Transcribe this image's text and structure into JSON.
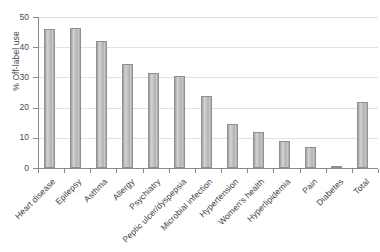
{
  "chart_data": {
    "type": "bar",
    "title": "",
    "xlabel": "",
    "ylabel": "% Off-label use",
    "ylim": [
      0,
      50
    ],
    "ytick_labels": [
      "0",
      "10",
      "20",
      "30",
      "40",
      "50"
    ],
    "yticks": [
      0,
      10,
      20,
      30,
      40,
      50
    ],
    "grid": true,
    "legend": "none",
    "categories": [
      "Heart disease",
      "Epilepsy",
      "Asthma",
      "Allergy",
      "Psychiatry",
      "Peptic ulcer/dyspepsia",
      "Microbial infection",
      "Hypertension",
      "Women's health",
      "Hyperlipidemia",
      "Pain",
      "Diabetes",
      "Total"
    ],
    "values": [
      46,
      46.2,
      42,
      34.5,
      31.5,
      30.5,
      24,
      14.5,
      11.8,
      9,
      7,
      0.8,
      22
    ]
  },
  "colors": {
    "bar_fill": "#c2c2c2",
    "bar_edge": "#8f8f8f",
    "gridline": "#e2e2e2",
    "axis": "#8a8a8a",
    "text": "#3f3f3f",
    "background": "#ffffff"
  }
}
